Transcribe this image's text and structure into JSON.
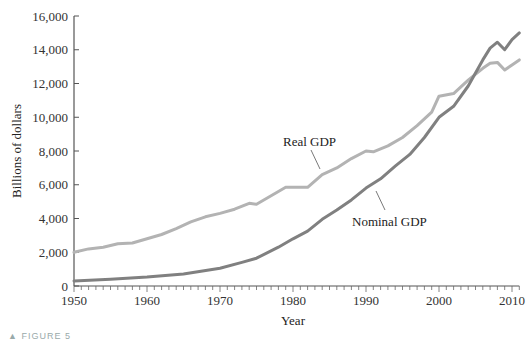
{
  "chart_data": {
    "type": "line",
    "title": "",
    "xlabel": "Year",
    "ylabel": "Billions of dollars",
    "xlim": [
      1950,
      2011
    ],
    "ylim": [
      0,
      16000
    ],
    "x_ticks": [
      1950,
      1960,
      1970,
      1980,
      1990,
      2000,
      2010
    ],
    "y_ticks": [
      0,
      2000,
      4000,
      6000,
      8000,
      10000,
      12000,
      14000,
      16000
    ],
    "y_tick_labels": [
      "0",
      "2,000",
      "4,000",
      "6,000",
      "8,000",
      "10,000",
      "12,000",
      "14,000",
      "16,000"
    ],
    "x_tick_labels": [
      "1950",
      "1960",
      "1970",
      "1980",
      "1990",
      "2000",
      "2010"
    ],
    "grid": false,
    "legend": "none (inline annotations)",
    "series": [
      {
        "name": "Real GDP",
        "color": "#b3b3b3",
        "x": [
          1950,
          1952,
          1954,
          1956,
          1958,
          1960,
          1962,
          1964,
          1966,
          1968,
          1970,
          1972,
          1974,
          1975,
          1977,
          1979,
          1980,
          1982,
          1984,
          1986,
          1988,
          1990,
          1991,
          1993,
          1995,
          1997,
          1999,
          2000,
          2002,
          2004,
          2006,
          2007,
          2008,
          2009,
          2010,
          2011
        ],
        "values": [
          2000,
          2200,
          2300,
          2500,
          2550,
          2800,
          3050,
          3400,
          3800,
          4100,
          4300,
          4550,
          4900,
          4850,
          5350,
          5850,
          5850,
          5850,
          6600,
          7000,
          7550,
          8000,
          7950,
          8300,
          8800,
          9500,
          10300,
          11250,
          11400,
          12200,
          12900,
          13200,
          13250,
          12800,
          13100,
          13400
        ]
      },
      {
        "name": "Nominal GDP",
        "color": "#808080",
        "x": [
          1950,
          1955,
          1960,
          1965,
          1970,
          1973,
          1975,
          1978,
          1980,
          1982,
          1984,
          1986,
          1988,
          1990,
          1992,
          1994,
          1996,
          1998,
          2000,
          2002,
          2004,
          2006,
          2007,
          2008,
          2009,
          2010,
          2011
        ],
        "values": [
          300,
          400,
          530,
          720,
          1050,
          1400,
          1650,
          2300,
          2800,
          3250,
          3950,
          4500,
          5100,
          5800,
          6350,
          7100,
          7800,
          8800,
          10000,
          10650,
          11850,
          13400,
          14100,
          14450,
          14000,
          14600,
          15000
        ]
      }
    ],
    "annotations": [
      {
        "text": "Real GDP",
        "x_px": 280,
        "y_px": 142,
        "pointer_to": "Real GDP line ~1983"
      },
      {
        "text": "Nominal GDP",
        "x_px": 352,
        "y_px": 222,
        "pointer_to": "Nominal GDP line ~1987"
      }
    ]
  },
  "labels": {
    "ylabel": "Billions of dollars",
    "xlabel": "Year",
    "real_gdp": "Real GDP",
    "nominal_gdp": "Nominal GDP",
    "caption": "▲ FIGURE 5"
  }
}
